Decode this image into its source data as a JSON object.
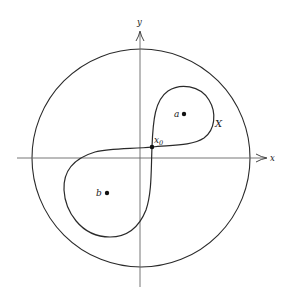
{
  "diagram": {
    "axes": {
      "x_label": "x",
      "y_label": "y"
    },
    "labels": {
      "point_a": "a",
      "point_b": "b",
      "base_point": "x",
      "base_point_sub": "0",
      "curve": "X"
    },
    "colors": {
      "stroke": "#2a2a2a",
      "axis": "#555555",
      "background": "#ffffff"
    }
  }
}
